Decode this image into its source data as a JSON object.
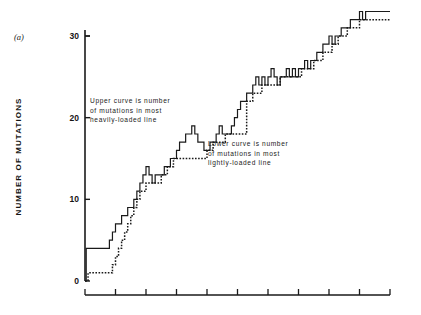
{
  "figure": {
    "panel_label": "(a)",
    "background": "#ffffff",
    "ink_color": "#1a1a1a"
  },
  "annotations": {
    "upper": "Upper curve is number\nof mutations in most\nheavily-loaded line",
    "lower": "Lower curve is number\nof mutations in most\nlightly-loaded line"
  },
  "chart_data": {
    "type": "line",
    "title": "",
    "subtitle": "",
    "xlabel": "",
    "ylabel": "NUMBER OF MUTATIONS",
    "ylim": [
      0,
      33
    ],
    "xlim": [
      0,
      100
    ],
    "y_ticks": [
      0,
      10,
      20,
      30
    ],
    "y_tick_labels": [
      "0",
      "10",
      "20",
      "30"
    ],
    "x_ticks": [
      0,
      10,
      20,
      30,
      40,
      50,
      60,
      70,
      80,
      90,
      100
    ],
    "x_tick_labels": [
      "",
      "",
      "",
      "",
      "",
      "",
      "",
      "",
      "",
      "",
      ""
    ],
    "grid": false,
    "legend": "none",
    "step_style": "post",
    "series": [
      {
        "name": "Upper curve is number of mutations in most heavily-loaded line",
        "line_style": "solid",
        "color": "#1a1a1a",
        "x": [
          0.0,
          0.4,
          1.0,
          2.0,
          3.0,
          4.0,
          5.0,
          6.0,
          7.0,
          8.0,
          9.0,
          10.0,
          11.0,
          12.0,
          13.0,
          14.0,
          15.0,
          16.0,
          17.0,
          18.0,
          19.0,
          20.0,
          21.0,
          22.0,
          23.0,
          24.0,
          25.0,
          26.0,
          27.0,
          28.0,
          29.0,
          30.0,
          31.0,
          32.0,
          33.0,
          34.0,
          35.0,
          36.0,
          37.0,
          38.0,
          39.0,
          40.0,
          41.0,
          42.0,
          43.0,
          44.0,
          45.0,
          46.0,
          47.0,
          48.0,
          49.0,
          50.0,
          51.0,
          52.0,
          53.0,
          54.0,
          55.0,
          56.0,
          57.0,
          58.0,
          59.0,
          60.0,
          61.0,
          62.0,
          63.0,
          64.0,
          65.0,
          66.0,
          67.0,
          68.0,
          69.0,
          70.0,
          71.0,
          72.0,
          73.0,
          74.0,
          75.0,
          76.0,
          77.0,
          78.0,
          79.0,
          80.0,
          81.0,
          82.0,
          83.0,
          84.0,
          85.0,
          86.0,
          87.0,
          88.0,
          89.0,
          90.0,
          91.0,
          92.0,
          93.0,
          94.0,
          95.0,
          96.0,
          97.0,
          98.0,
          99.0,
          100.0
        ],
        "y": [
          0,
          4,
          4,
          4,
          4,
          4,
          4,
          4,
          4,
          5,
          6,
          7,
          7,
          8,
          8,
          9,
          9,
          10,
          11,
          12,
          13,
          14,
          13,
          12,
          13,
          13,
          13,
          14,
          14,
          15,
          15,
          16,
          17,
          17,
          18,
          18,
          19,
          18,
          17,
          17,
          16,
          16,
          17,
          17,
          18,
          19,
          18,
          18,
          18,
          19,
          20,
          21,
          22,
          22,
          23,
          23,
          24,
          25,
          24,
          25,
          24,
          25,
          26,
          25,
          24,
          25,
          25,
          26,
          25,
          26,
          25,
          26,
          26,
          27,
          26,
          27,
          27,
          28,
          28,
          29,
          29,
          30,
          29,
          30,
          30,
          31,
          31,
          31,
          32,
          32,
          32,
          33,
          32,
          33,
          33,
          33,
          33,
          33,
          33,
          33,
          33,
          33
        ]
      },
      {
        "name": "Lower curve is number of mutations in most lightly-loaded line",
        "line_style": "dotted",
        "color": "#1a1a1a",
        "x": [
          0.0,
          0.4,
          1.0,
          2.0,
          3.0,
          4.0,
          5.0,
          6.0,
          7.0,
          8.0,
          9.0,
          10.0,
          11.0,
          12.0,
          13.0,
          14.0,
          15.0,
          16.0,
          17.0,
          18.0,
          19.0,
          20.0,
          21.0,
          22.0,
          23.0,
          24.0,
          25.0,
          26.0,
          27.0,
          28.0,
          29.0,
          30.0,
          31.0,
          32.0,
          33.0,
          34.0,
          35.0,
          36.0,
          37.0,
          38.0,
          39.0,
          40.0,
          41.0,
          42.0,
          43.0,
          44.0,
          45.0,
          46.0,
          47.0,
          48.0,
          49.0,
          50.0,
          51.0,
          52.0,
          53.0,
          54.0,
          55.0,
          56.0,
          57.0,
          58.0,
          59.0,
          60.0,
          61.0,
          62.0,
          63.0,
          64.0,
          65.0,
          66.0,
          67.0,
          68.0,
          69.0,
          70.0,
          71.0,
          72.0,
          73.0,
          74.0,
          75.0,
          76.0,
          77.0,
          78.0,
          79.0,
          80.0,
          81.0,
          82.0,
          83.0,
          84.0,
          85.0,
          86.0,
          87.0,
          88.0,
          89.0,
          90.0,
          91.0,
          92.0,
          93.0,
          94.0,
          95.0,
          96.0,
          97.0,
          98.0,
          99.0,
          100.0
        ],
        "y": [
          0,
          0,
          1,
          1,
          1,
          1,
          1,
          1,
          1,
          1,
          2,
          3,
          4,
          5,
          6,
          7,
          8,
          9,
          10,
          11,
          11,
          12,
          12,
          12,
          12,
          12,
          13,
          13,
          14,
          14,
          15,
          15,
          15,
          15,
          15,
          15,
          15,
          15,
          15,
          15,
          15,
          16,
          16,
          17,
          17,
          17,
          17,
          18,
          18,
          18,
          18,
          18,
          18,
          18,
          22,
          22,
          23,
          23,
          23,
          24,
          24,
          24,
          24,
          24,
          24,
          25,
          25,
          25,
          25,
          25,
          25,
          25,
          26,
          26,
          26,
          26,
          27,
          27,
          27,
          28,
          28,
          28,
          29,
          29,
          30,
          30,
          30,
          31,
          31,
          31,
          31,
          32,
          32,
          32,
          32,
          32,
          32,
          32,
          32,
          32,
          32,
          32
        ]
      }
    ]
  }
}
